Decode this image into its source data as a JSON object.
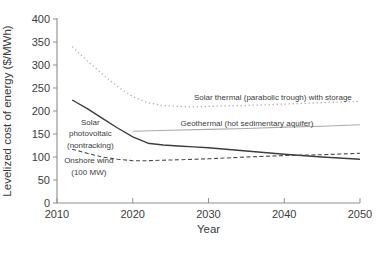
{
  "chart_data": {
    "type": "line",
    "title": "",
    "xlabel": "Year",
    "ylabel": "Levelized cost of energy ($/MWh)",
    "xlim": [
      2010,
      2050
    ],
    "ylim": [
      0,
      400
    ],
    "x_ticks": [
      2010,
      2020,
      2030,
      2040,
      2050
    ],
    "y_ticks": [
      0,
      50,
      100,
      150,
      200,
      250,
      300,
      350,
      400
    ],
    "grid": false,
    "legend": "inline-annotations",
    "axis_color": "#8f8f8f",
    "text_color": "#3d3d3d",
    "series": [
      {
        "id": "solar-thermal",
        "name": "Solar thermal (parabolic trough) with storage",
        "style": "dotted",
        "color": "#b3b3b3",
        "width": 1.3,
        "points": [
          [
            2012,
            340
          ],
          [
            2014,
            309
          ],
          [
            2016,
            280
          ],
          [
            2018,
            253
          ],
          [
            2020,
            231
          ],
          [
            2022,
            218
          ],
          [
            2024,
            212
          ],
          [
            2026,
            210
          ],
          [
            2028,
            209
          ],
          [
            2030,
            210
          ],
          [
            2032,
            211
          ],
          [
            2035,
            212
          ],
          [
            2040,
            215
          ],
          [
            2045,
            218
          ],
          [
            2050,
            221
          ]
        ]
      },
      {
        "id": "solar-pv",
        "name": "Solar photovoltaic (nontracking)",
        "style": "solid",
        "color": "#3d3d3d",
        "width": 1.4,
        "points": [
          [
            2012,
            224
          ],
          [
            2014,
            205
          ],
          [
            2016,
            184
          ],
          [
            2018,
            163
          ],
          [
            2020,
            144
          ],
          [
            2022,
            130
          ],
          [
            2024,
            126
          ],
          [
            2026,
            124
          ],
          [
            2028,
            122
          ],
          [
            2030,
            120
          ],
          [
            2035,
            113
          ],
          [
            2040,
            106
          ],
          [
            2045,
            100
          ],
          [
            2050,
            95
          ]
        ]
      },
      {
        "id": "geothermal",
        "name": "Geothermal (hot sedimentary aquifer)",
        "style": "solid",
        "color": "#ababab",
        "width": 1.1,
        "points": [
          [
            2020,
            156
          ],
          [
            2025,
            158
          ],
          [
            2030,
            160
          ],
          [
            2035,
            162
          ],
          [
            2040,
            165
          ],
          [
            2045,
            167
          ],
          [
            2050,
            170
          ]
        ]
      },
      {
        "id": "onshore-wind",
        "name": "Onshore wind (100 MW)",
        "style": "dashed",
        "color": "#4a4a4a",
        "width": 1.1,
        "points": [
          [
            2012,
            117
          ],
          [
            2014,
            108
          ],
          [
            2016,
            100
          ],
          [
            2018,
            95
          ],
          [
            2020,
            92
          ],
          [
            2022,
            92
          ],
          [
            2024,
            93
          ],
          [
            2026,
            94
          ],
          [
            2028,
            95
          ],
          [
            2030,
            96
          ],
          [
            2035,
            100
          ],
          [
            2040,
            103
          ],
          [
            2045,
            105
          ],
          [
            2050,
            108
          ]
        ]
      }
    ],
    "annotations": [
      {
        "id": "solar-thermal-label",
        "lines": [
          "Solar thermal (parabolic trough) with storage"
        ],
        "x": 2038.5,
        "y": 230,
        "anchor": "middle"
      },
      {
        "id": "geothermal-label",
        "lines": [
          "Geothermal (hot sedimentary aquifer)"
        ],
        "x": 2026.3,
        "y": 174,
        "anchor": "start"
      },
      {
        "id": "solar-pv-label",
        "lines": [
          "Solar",
          "photovoltaic",
          "(nontracking)"
        ],
        "x": 2014.4,
        "y": 152,
        "anchor": "middle"
      },
      {
        "id": "onshore-wind-label",
        "lines": [
          "Onshore wind",
          "(100 MW)"
        ],
        "x": 2014.2,
        "y": 80,
        "anchor": "middle"
      }
    ]
  }
}
